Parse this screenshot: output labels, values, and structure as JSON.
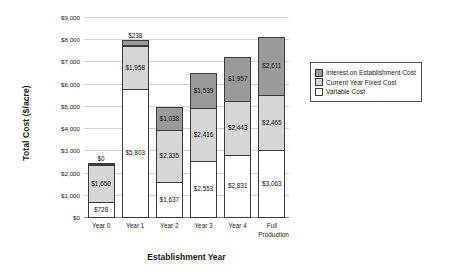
{
  "chart_data": {
    "type": "bar",
    "stacked": true,
    "title": "",
    "xlabel": "Establishment Year",
    "ylabel": "Total Cost ($/acre)",
    "ylim": [
      0,
      9000
    ],
    "ytick_step": 1000,
    "ytick_labels": [
      "$0",
      "$1,000",
      "$2,000",
      "$3,000",
      "$4,000",
      "$5,000",
      "$6,000",
      "$7,000",
      "$8,000",
      "$9,000"
    ],
    "grid": true,
    "legend_position": "right",
    "categories": [
      "Year 0",
      "Year 1",
      "Year 2",
      "Year 3",
      "Year 4",
      "Full Production"
    ],
    "series": [
      {
        "name": "Variable Cost",
        "color": "#ffffff",
        "values": [
          728,
          5803,
          1637,
          2553,
          2831,
          3063
        ],
        "labels": [
          "$728",
          "$5,803",
          "$1,637",
          "$2,553",
          "$2,831",
          "$3,063"
        ]
      },
      {
        "name": "Current Year Fixed Cost",
        "color": "#d6d6d6",
        "values": [
          1650,
          1958,
          2335,
          2416,
          2443,
          2465
        ],
        "labels": [
          "$1,650",
          "$1,958",
          "$2,335",
          "$2,416",
          "$2,443",
          "$2,465"
        ]
      },
      {
        "name": "Interest on Establishment Cost",
        "color": "#9a9a9a",
        "values": [
          0,
          238,
          1038,
          1539,
          1957,
          2611
        ],
        "labels": [
          "$0",
          "$238",
          "$1,038",
          "$1,539",
          "$1,957",
          "$2,611"
        ]
      }
    ],
    "totals": [
      2378,
      7999,
      5010,
      6508,
      7231,
      8139
    ]
  },
  "legend": {
    "items": [
      {
        "label": "Interest on Establishment Cost",
        "key": "interest"
      },
      {
        "label": "Current Year Fixed Cost",
        "key": "fixed"
      },
      {
        "label": "Variable Cost",
        "key": "variable"
      }
    ]
  }
}
